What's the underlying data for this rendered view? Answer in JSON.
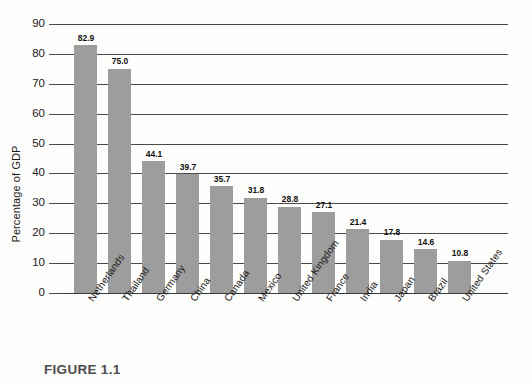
{
  "figure": {
    "caption": "FIGURE 1.1"
  },
  "chart_data": {
    "type": "bar",
    "title": "",
    "xlabel": "",
    "ylabel": "Percentage of GDP",
    "ylim": [
      0,
      90
    ],
    "ytick_step": 10,
    "yticks": [
      0,
      10,
      20,
      30,
      40,
      50,
      60,
      70,
      80,
      90
    ],
    "ytick_labels": [
      "0",
      "10",
      "20",
      "30",
      "40",
      "50",
      "60",
      "70",
      "80",
      "90"
    ],
    "grid": true,
    "legend": "none",
    "bar_color": "#9d9d9d",
    "categories": [
      "Netherlands",
      "Thailand",
      "Germany",
      "China",
      "Canada",
      "Mexico",
      "United Kingdom",
      "France",
      "India",
      "Japan",
      "Brazil",
      "United States"
    ],
    "values": [
      82.9,
      75.0,
      44.1,
      39.7,
      35.7,
      31.8,
      28.8,
      27.1,
      21.4,
      17.8,
      14.6,
      10.8
    ],
    "value_labels": [
      "82.9",
      "75.0",
      "44.1",
      "39.7",
      "35.7",
      "31.8",
      "28.8",
      "27.1",
      "21.4",
      "17.8",
      "14.6",
      "10.8"
    ]
  }
}
